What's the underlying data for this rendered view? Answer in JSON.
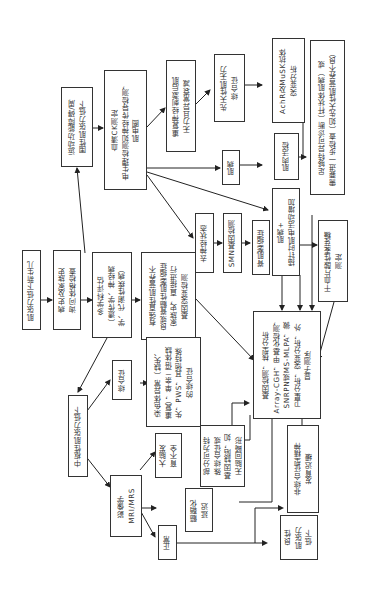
{
  "diagram": {
    "orientation": "rotated 90° counter-clockwise",
    "nodes": {
      "start": "肌张力低下新生儿",
      "history": "病史及家族史\n询问体格检查",
      "mdt": "多学科评估\n（遗传学、神经病\n学、代谢性疾病）",
      "motor": "运动功能障碍/周\n围性肌张力低下",
      "ck": "血清CK测定\n电生理检测如神经传导检测，\n肌电图",
      "rns": "重复神经刺激后肌\n无力且异常衰减",
      "cms": "先天性肌无力\n综合征",
      "achr": "AchR及MuSK抗体\n突变分析",
      "myopathy": "肌病",
      "biopsy": "肌肉活检",
      "diag": "足够特异可诊断（杆状体肌病）或\n需要进一步检查（如先天性肌营养不良）",
      "denerv": "去神经状态",
      "smn": "SMN基因检测",
      "sma": "脊肌萎缩症",
      "emg": "肌病+\n插针时肌电活动增加",
      "plasma": "干血片酸性麦芽糖\n测定",
      "strong": "有强直性肌营养不\n良或脊髓性肌萎缩症\n家族史，直接进行\n基因突变检测",
      "gene": "基因检测，核型分析\nArray-CGH，甲基化检测，\nSNRPN或MS-MLPA，微\n卫星分析，突变分析，外\n显子测序",
      "central": "中枢性肌张力低下",
      "syndrome": "综合征",
      "chrom": "染色体异常（缺失、\n重复），单亲二倍体缺\n失，PWS，其他特殊\n的综合征",
      "imaging": "影像学\nMRI/MRS",
      "cerebral": "大脑发\n育不全",
      "partial": "部分可为特\n殊综合征或\n基因缺陷，如\n无脑回畸形",
      "myelin": "髓鞘化\n延迟",
      "normal": "正常",
      "nonsynd": "非综合征型精神\n发育迟缓",
      "benign": "良性\n肌张力\n低下"
    }
  }
}
